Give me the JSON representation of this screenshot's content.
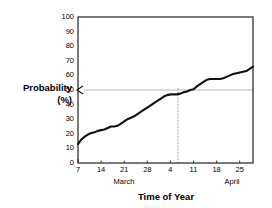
{
  "chart_data": {
    "type": "line",
    "title": "",
    "xlabel": "Time of Year",
    "ylabel": "Probability (%)",
    "ylabel_line1": "Probability",
    "ylabel_line2": "(%)",
    "ylim": [
      0,
      100
    ],
    "ytick_labels": [
      "0",
      "10",
      "20",
      "30",
      "40",
      "50",
      "60",
      "70",
      "80",
      "90",
      "100"
    ],
    "ytick_values": [
      0,
      10,
      20,
      30,
      40,
      50,
      60,
      70,
      80,
      90,
      100
    ],
    "xtick_labels": [
      "7",
      "14",
      "21",
      "28",
      "4",
      "11",
      "18",
      "25"
    ],
    "xtick_values": [
      7,
      14,
      21,
      28,
      35,
      42,
      49,
      56
    ],
    "xlim": [
      7,
      60
    ],
    "group_labels": [
      "March",
      "April"
    ],
    "grid": false,
    "legend": null,
    "series": [
      {
        "name": "Cumulative probability",
        "color": "#111111",
        "x": [
          7,
          8,
          9,
          10,
          11,
          12,
          13,
          14,
          15,
          16,
          17,
          18,
          19,
          20,
          21,
          22,
          23,
          24,
          25,
          26,
          27,
          28,
          29,
          30,
          31,
          32,
          33,
          34,
          35,
          36,
          37,
          38,
          39,
          40,
          41,
          42,
          43,
          44,
          45,
          46,
          47,
          48,
          49,
          50,
          51,
          52,
          53,
          54,
          55,
          56,
          57,
          58,
          59,
          60
        ],
        "values": [
          13,
          16,
          18,
          19.5,
          20.5,
          21,
          22,
          22.5,
          23,
          24,
          25,
          25,
          25.5,
          27,
          28.5,
          30,
          31,
          32,
          33.5,
          35,
          36.5,
          38,
          39.5,
          41,
          42.5,
          44,
          45.5,
          46.5,
          47,
          47,
          47,
          47.5,
          48.5,
          49,
          50,
          50.5,
          52.5,
          54,
          55.5,
          57,
          57.5,
          57.5,
          57.5,
          57.5,
          58,
          59,
          60,
          61,
          61.5,
          62,
          62.5,
          63,
          64.5,
          66
        ]
      }
    ],
    "annotations": [
      {
        "type": "reference-line-horizontal",
        "value": 50,
        "label": "50% probability reference",
        "style": "solid-thin-with-left-arrow"
      },
      {
        "type": "reference-line-vertical",
        "value": 41,
        "label": "date at 50% probability",
        "style": "dotted"
      }
    ]
  }
}
